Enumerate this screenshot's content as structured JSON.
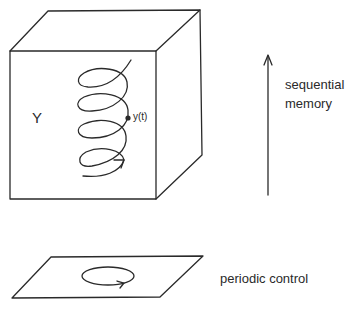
{
  "diagram": {
    "state_space_label": "Y",
    "trajectory_point_label": "y(t)",
    "memory_axis": {
      "line1": "sequential",
      "line2": "memory"
    },
    "control_plane_label": "periodic control"
  },
  "colors": {
    "ink": "#2a2a2a",
    "background": "#ffffff"
  }
}
